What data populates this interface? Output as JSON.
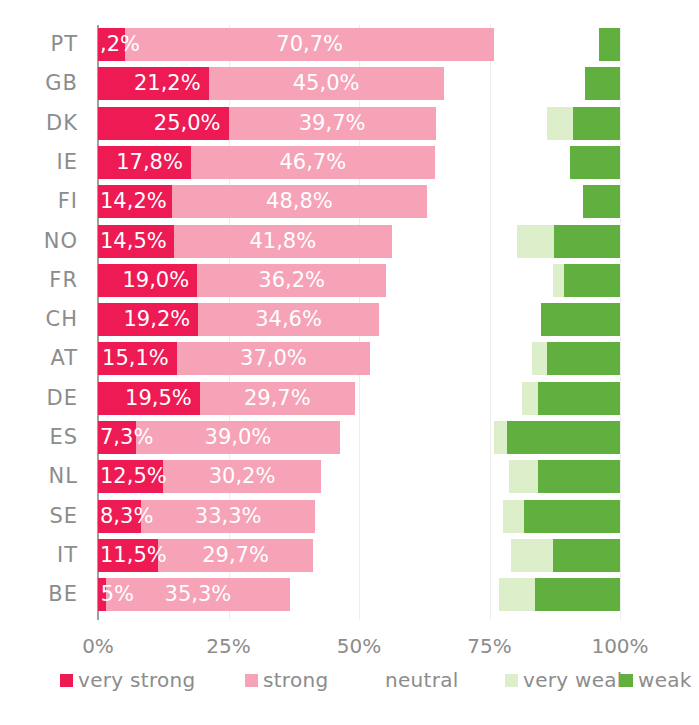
{
  "chart_data": {
    "type": "bar",
    "subtype": "diverging-stacked-bar",
    "title": "",
    "xlabel": "",
    "ylabel": "",
    "xlim": [
      0,
      100
    ],
    "grid": true,
    "legend_position": "bottom",
    "xticks": [
      "0%",
      "25%",
      "50%",
      "75%",
      "100%"
    ],
    "xtick_values": [
      0,
      25,
      50,
      75,
      100
    ],
    "categories": [
      "PT",
      "GB",
      "DK",
      "IE",
      "FI",
      "NO",
      "FR",
      "CH",
      "AT",
      "DE",
      "ES",
      "NL",
      "SE",
      "IT",
      "BE"
    ],
    "series": [
      {
        "name": "very strong",
        "color": "#ED1A53",
        "values": [
          5.2,
          21.2,
          25.0,
          17.8,
          14.2,
          14.5,
          19.0,
          19.2,
          15.1,
          19.5,
          7.3,
          12.5,
          8.3,
          11.5,
          1.5
        ],
        "labels": [
          ",2%",
          "21,2%",
          "25,0%",
          "17,8%",
          "14,2%",
          "14,5%",
          "19,0%",
          "19,2%",
          "15,1%",
          "19,5%",
          "7,3%",
          "12,5%",
          "8,3%",
          "11,5%",
          "5%"
        ]
      },
      {
        "name": "strong",
        "color": "#F6A3B7",
        "values": [
          70.7,
          45.0,
          39.7,
          46.7,
          48.8,
          41.8,
          36.2,
          34.6,
          37.0,
          29.7,
          39.0,
          30.2,
          33.3,
          29.7,
          35.3
        ],
        "labels": [
          "70,7%",
          "45,0%",
          "39,7%",
          "46,7%",
          "48,8%",
          "41,8%",
          "36,2%",
          "34,6%",
          "37,0%",
          "29,7%",
          "39,0%",
          "30,2%",
          "33,3%",
          "29,7%",
          "35,3%"
        ]
      },
      {
        "name": "neutral",
        "color": "#ffffff",
        "values": [
          20.0,
          27.0,
          21.3,
          26.0,
          30.0,
          24.0,
          32.0,
          31.0,
          31.0,
          32.0,
          29.5,
          36.0,
          36.0,
          38.0,
          40.0
        ],
        "labels": [
          "",
          "",
          "",
          "",
          "",
          "",
          "",
          "",
          "",
          "",
          "",
          "",
          "",
          "",
          ""
        ]
      },
      {
        "name": "very weak",
        "color": "#DDEECB",
        "values": [
          0.0,
          0.0,
          5.0,
          0.0,
          0.0,
          7.0,
          2.0,
          0.0,
          3.0,
          3.0,
          2.5,
          5.5,
          4.0,
          8.0,
          7.0
        ],
        "labels": [
          "",
          "",
          "",
          "",
          "",
          "",
          "",
          "",
          "",
          "",
          "",
          "",
          "",
          "",
          ""
        ]
      },
      {
        "name": "weak",
        "color": "#61AF3E",
        "values": [
          4.1,
          6.8,
          9.0,
          9.5,
          7.0,
          12.7,
          10.8,
          15.2,
          13.9,
          15.8,
          21.7,
          15.8,
          18.4,
          12.8,
          16.2
        ],
        "labels": [
          "",
          "",
          "",
          "",
          "",
          "",
          "",
          "",
          "",
          "",
          "",
          "",
          "",
          "",
          ""
        ]
      }
    ]
  },
  "legend": {
    "items": [
      {
        "label": "very strong",
        "color": "#ED1A53",
        "swatch": true
      },
      {
        "label": "strong",
        "color": "#F6A3B7",
        "swatch": true
      },
      {
        "label": "neutral",
        "color": "#ffffff",
        "swatch": false
      },
      {
        "label": "very weak",
        "color": "#DDEECB",
        "swatch": true
      },
      {
        "label": "weak",
        "color": "#61AF3E",
        "swatch": true
      }
    ]
  },
  "colors": {
    "very_strong": "#ED1A53",
    "strong": "#F6A3B7",
    "neutral": "#ffffff",
    "very_weak": "#DDEECB",
    "weak": "#61AF3E",
    "axis": "#9aa59a",
    "gridline": "#ececec",
    "tick_text": "#8c8c8c",
    "bar_label_text": "#ffffff"
  }
}
